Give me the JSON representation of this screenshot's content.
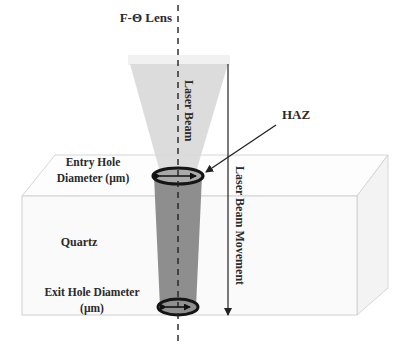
{
  "diagram": {
    "labels": {
      "lens": "F-Θ Lens",
      "laser_beam": "Laser Beam",
      "haz": "HAZ",
      "entry_hole_line1": "Entry Hole",
      "entry_hole_line2": "Diameter (µm)",
      "material": "Quartz",
      "exit_hole_line1": "Exit Hole Diameter",
      "exit_hole_line2": "(µm)",
      "beam_movement": "Laser Beam Movement"
    },
    "colors": {
      "box_edge": "#d0d0d0",
      "box_face": "#fbfbfb",
      "box_side": "#f2f2f2",
      "beam": "#d6d6d6",
      "lens": "#efefef",
      "hole": "#8c8c8c",
      "ring": "#1a1a1a",
      "line": "#222222"
    }
  }
}
